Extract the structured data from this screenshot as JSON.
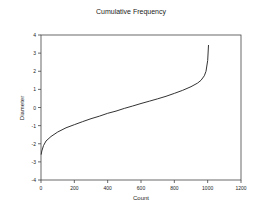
{
  "chart_data": {
    "type": "line",
    "title": "Cumulative Frequency",
    "xlabel": "Count",
    "ylabel": "Diameter",
    "xlim": [
      0,
      1200
    ],
    "ylim": [
      -4,
      4
    ],
    "xticks": [
      0,
      200,
      400,
      600,
      800,
      1000,
      1200
    ],
    "yticks": [
      -4,
      -3,
      -2,
      -1,
      0,
      1,
      2,
      3,
      4
    ],
    "grid": false,
    "legend": null,
    "series": [
      {
        "name": "Diameter",
        "color": "#333333",
        "x": [
          1,
          5,
          15,
          30,
          60,
          100,
          150,
          200,
          250,
          300,
          350,
          400,
          450,
          500,
          550,
          600,
          650,
          700,
          750,
          800,
          850,
          900,
          940,
          960,
          980,
          990,
          1000,
          1005
        ],
        "y": [
          -2.6,
          -2.4,
          -2.1,
          -1.85,
          -1.6,
          -1.35,
          -1.12,
          -0.95,
          -0.78,
          -0.62,
          -0.48,
          -0.32,
          -0.2,
          -0.05,
          0.08,
          0.22,
          0.35,
          0.48,
          0.62,
          0.78,
          0.95,
          1.15,
          1.35,
          1.5,
          1.75,
          2.0,
          2.6,
          3.45
        ]
      }
    ]
  }
}
